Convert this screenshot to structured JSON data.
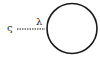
{
  "diagram": {
    "source_label": "ς",
    "edge_label": "λ",
    "edge_style": "dashed",
    "node_shape": "circle",
    "colors": {
      "stroke": "#1a1a1a",
      "background": "#ffffff"
    }
  }
}
